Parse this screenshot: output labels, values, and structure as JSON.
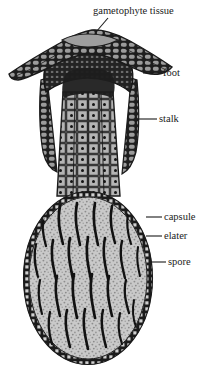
{
  "figure": {
    "background_color": "#ffffff",
    "ink_color": "#1b1b1b"
  },
  "labels": {
    "gametophyte_tissue": "gametophyte tissue",
    "foot": "foot",
    "stalk": "stalk",
    "capsule": "capsule",
    "elater": "elater",
    "spore": "spore"
  },
  "parts": {
    "gametophyte_tissue": {
      "name": "gametophyte tissue",
      "fill_color": "#8f8f8f",
      "description": "wing-like cellular canopy across the top spanning the full width"
    },
    "foot": {
      "name": "foot",
      "fill_color": "#2a2a2a",
      "description": "dark densely celled dome embedded beneath the canopy"
    },
    "stalk": {
      "name": "stalk",
      "fill_color": "#9a9a9a",
      "description": "tapering column of rectangular nucleated cells joining foot to capsule"
    },
    "capsule": {
      "name": "capsule",
      "fill_color": "#c9c9c9",
      "wall_color": "#1b1b1b",
      "description": "large oval sporangium with a beaded single-cell-thick wall"
    },
    "elater": {
      "name": "elater",
      "color": "#111111",
      "count": 26,
      "description": "slender dark sigmoid filaments distributed inside the capsule"
    },
    "spore": {
      "name": "spore",
      "color": "#8a8a8a",
      "description": "fine stippled dots filling the capsule interior"
    }
  },
  "leader_lines": {
    "gametophyte_tissue": {
      "from": [
        96,
        32
      ],
      "to": [
        108,
        18
      ]
    },
    "foot": {
      "from": [
        143,
        73
      ],
      "to": [
        161,
        73
      ]
    },
    "stalk": {
      "from": [
        137,
        119
      ],
      "to": [
        157,
        119
      ]
    },
    "capsule": {
      "from": [
        146,
        217
      ],
      "to": [
        162,
        217
      ]
    },
    "elater": {
      "from": [
        146,
        236
      ],
      "to": [
        162,
        236
      ]
    },
    "spore": {
      "from": [
        150,
        262
      ],
      "to": [
        166,
        262
      ]
    }
  }
}
